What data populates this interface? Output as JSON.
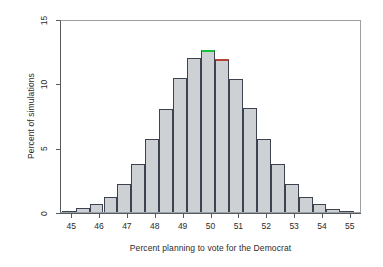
{
  "chart_data": {
    "type": "bar",
    "title": "",
    "subtitle": "",
    "xlabel": "Percent planning to vote for the Democrat",
    "ylabel": "Percent of simulations",
    "xlim": [
      44.6,
      55.4
    ],
    "ylim": [
      0,
      15
    ],
    "grid": false,
    "legend": null,
    "bin_width": 0.5,
    "xticks": [
      45,
      46,
      47,
      48,
      49,
      50,
      51,
      52,
      53,
      54,
      55
    ],
    "yticks": [
      0,
      5,
      10,
      15
    ],
    "bin_centers": [
      44.875,
      45.375,
      45.875,
      46.375,
      46.875,
      47.375,
      47.875,
      48.375,
      48.875,
      49.375,
      49.875,
      50.375,
      50.875,
      51.375,
      51.875,
      52.375,
      52.875,
      53.375,
      53.875,
      54.375,
      54.875
    ],
    "categories": [
      "44.75-45.25",
      "45.25-45.75",
      "45.75-46.25",
      "46.25-46.75",
      "46.75-47.25",
      "47.25-47.75",
      "47.75-48.25",
      "48.25-48.75",
      "48.75-49.25",
      "49.25-49.75",
      "49.75-50.25",
      "50.25-50.75",
      "50.75-51.25",
      "51.25-51.75",
      "51.75-52.25",
      "52.25-52.75",
      "52.75-53.25",
      "53.25-53.75",
      "53.75-54.25",
      "54.25-54.75",
      "54.75-55.25"
    ],
    "values": [
      0.1,
      0.3,
      0.6,
      1.2,
      2.2,
      3.7,
      5.7,
      8.0,
      10.4,
      12.0,
      12.6,
      11.9,
      10.3,
      8.1,
      5.7,
      3.7,
      2.2,
      1.2,
      0.6,
      0.25,
      0.1
    ],
    "bar_colors": {
      "fill": "#ced1d3",
      "border": "#3c4250"
    },
    "highlights": [
      {
        "bin_center": 49.875,
        "edge_color": "#18c23a",
        "note": "green top edge on tallest bar"
      },
      {
        "bin_center": 50.375,
        "edge_color": "#b7443a",
        "note": "red top edge on adjacent bar"
      }
    ]
  }
}
